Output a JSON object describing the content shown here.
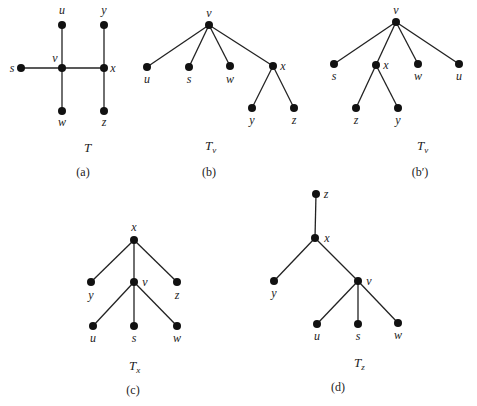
{
  "figures": [
    {
      "id": "a",
      "caption": "(a)",
      "tree_name": "T",
      "tree_sub": "",
      "name_pos": [
        84,
        152
      ],
      "caption_pos": [
        83,
        176
      ],
      "nodes": [
        {
          "id": "u",
          "x": 62,
          "y": 25,
          "lx": 62,
          "ly": 14,
          "anchor": "middle"
        },
        {
          "id": "y",
          "x": 104,
          "y": 25,
          "lx": 104,
          "ly": 14,
          "anchor": "middle"
        },
        {
          "id": "s",
          "x": 21,
          "y": 68,
          "lx": 12,
          "ly": 72,
          "anchor": "middle"
        },
        {
          "id": "v",
          "x": 62,
          "y": 68,
          "lx": 55,
          "ly": 62,
          "anchor": "middle"
        },
        {
          "id": "x",
          "x": 104,
          "y": 68,
          "lx": 113,
          "ly": 72,
          "anchor": "middle"
        },
        {
          "id": "w",
          "x": 62,
          "y": 111,
          "lx": 62,
          "ly": 126,
          "anchor": "middle"
        },
        {
          "id": "z",
          "x": 104,
          "y": 111,
          "lx": 104,
          "ly": 126,
          "anchor": "middle"
        }
      ],
      "edges": [
        [
          "u",
          "v"
        ],
        [
          "v",
          "w"
        ],
        [
          "s",
          "v"
        ],
        [
          "v",
          "x"
        ],
        [
          "y",
          "x"
        ],
        [
          "x",
          "z"
        ]
      ]
    },
    {
      "id": "b",
      "caption": "(b)",
      "tree_name": "T",
      "tree_sub": "v",
      "name_pos": [
        205,
        150
      ],
      "caption_pos": [
        209,
        176
      ],
      "nodes": [
        {
          "id": "v",
          "x": 209,
          "y": 25,
          "lx": 209,
          "ly": 17,
          "anchor": "middle"
        },
        {
          "id": "u",
          "x": 147,
          "y": 67,
          "lx": 147,
          "ly": 83,
          "anchor": "middle"
        },
        {
          "id": "s",
          "x": 189,
          "y": 67,
          "lx": 189,
          "ly": 83,
          "anchor": "middle"
        },
        {
          "id": "w",
          "x": 230,
          "y": 66,
          "lx": 230,
          "ly": 83,
          "anchor": "middle"
        },
        {
          "id": "x",
          "x": 273,
          "y": 66,
          "lx": 283,
          "ly": 70,
          "anchor": "middle"
        },
        {
          "id": "y",
          "x": 252,
          "y": 108,
          "lx": 252,
          "ly": 124,
          "anchor": "middle"
        },
        {
          "id": "z",
          "x": 294,
          "y": 108,
          "lx": 294,
          "ly": 124,
          "anchor": "middle"
        }
      ],
      "edges": [
        [
          "v",
          "u"
        ],
        [
          "v",
          "s"
        ],
        [
          "v",
          "w"
        ],
        [
          "v",
          "x"
        ],
        [
          "x",
          "y"
        ],
        [
          "x",
          "z"
        ]
      ]
    },
    {
      "id": "b-prime",
      "caption": "(b′)",
      "tree_name": "T",
      "tree_sub": "v",
      "name_pos": [
        417,
        150
      ],
      "caption_pos": [
        420,
        176
      ],
      "nodes": [
        {
          "id": "v",
          "x": 396,
          "y": 22,
          "lx": 396,
          "ly": 14,
          "anchor": "middle"
        },
        {
          "id": "s",
          "x": 334,
          "y": 64,
          "lx": 334,
          "ly": 80,
          "anchor": "middle"
        },
        {
          "id": "x",
          "x": 376,
          "y": 65,
          "lx": 386,
          "ly": 69,
          "anchor": "middle"
        },
        {
          "id": "w",
          "x": 418,
          "y": 64,
          "lx": 418,
          "ly": 80,
          "anchor": "middle"
        },
        {
          "id": "u",
          "x": 459,
          "y": 64,
          "lx": 459,
          "ly": 80,
          "anchor": "middle"
        },
        {
          "id": "z",
          "x": 356,
          "y": 108,
          "lx": 356,
          "ly": 124,
          "anchor": "middle"
        },
        {
          "id": "y",
          "x": 398,
          "y": 108,
          "lx": 398,
          "ly": 124,
          "anchor": "middle"
        }
      ],
      "edges": [
        [
          "v",
          "s"
        ],
        [
          "v",
          "x"
        ],
        [
          "v",
          "w"
        ],
        [
          "v",
          "u"
        ],
        [
          "x",
          "z"
        ],
        [
          "x",
          "y"
        ]
      ]
    },
    {
      "id": "c",
      "caption": "(c)",
      "tree_name": "T",
      "tree_sub": "x",
      "name_pos": [
        129,
        370
      ],
      "caption_pos": [
        133,
        394
      ],
      "nodes": [
        {
          "id": "x",
          "x": 134,
          "y": 240,
          "lx": 134,
          "ly": 231,
          "anchor": "middle"
        },
        {
          "id": "y",
          "x": 91,
          "y": 282,
          "lx": 91,
          "ly": 299,
          "anchor": "middle"
        },
        {
          "id": "v",
          "x": 134,
          "y": 282,
          "lx": 145,
          "ly": 286,
          "anchor": "middle"
        },
        {
          "id": "z",
          "x": 177,
          "y": 282,
          "lx": 177,
          "ly": 299,
          "anchor": "middle"
        },
        {
          "id": "u",
          "x": 93,
          "y": 326,
          "lx": 93,
          "ly": 342,
          "anchor": "middle"
        },
        {
          "id": "s",
          "x": 134,
          "y": 326,
          "lx": 134,
          "ly": 342,
          "anchor": "middle"
        },
        {
          "id": "w",
          "x": 177,
          "y": 326,
          "lx": 177,
          "ly": 342,
          "anchor": "middle"
        }
      ],
      "edges": [
        [
          "x",
          "y"
        ],
        [
          "x",
          "v"
        ],
        [
          "x",
          "z"
        ],
        [
          "v",
          "u"
        ],
        [
          "v",
          "s"
        ],
        [
          "v",
          "w"
        ]
      ]
    },
    {
      "id": "d",
      "caption": "(d)",
      "tree_name": "T",
      "tree_sub": "z",
      "name_pos": [
        354,
        367
      ],
      "caption_pos": [
        338,
        391
      ],
      "nodes": [
        {
          "id": "z",
          "x": 316,
          "y": 194,
          "lx": 326,
          "ly": 198,
          "anchor": "middle"
        },
        {
          "id": "x",
          "x": 315,
          "y": 238,
          "lx": 327,
          "ly": 242,
          "anchor": "middle"
        },
        {
          "id": "y",
          "x": 274,
          "y": 281,
          "lx": 274,
          "ly": 297,
          "anchor": "middle"
        },
        {
          "id": "v",
          "x": 358,
          "y": 281,
          "lx": 369,
          "ly": 285,
          "anchor": "middle"
        },
        {
          "id": "u",
          "x": 317,
          "y": 324,
          "lx": 317,
          "ly": 340,
          "anchor": "middle"
        },
        {
          "id": "s",
          "x": 358,
          "y": 324,
          "lx": 358,
          "ly": 340,
          "anchor": "middle"
        },
        {
          "id": "w",
          "x": 398,
          "y": 323,
          "lx": 398,
          "ly": 339,
          "anchor": "middle"
        }
      ],
      "edges": [
        [
          "z",
          "x"
        ],
        [
          "x",
          "y"
        ],
        [
          "x",
          "v"
        ],
        [
          "v",
          "u"
        ],
        [
          "v",
          "s"
        ],
        [
          "v",
          "w"
        ]
      ]
    }
  ],
  "style": {
    "node_color": "#111111",
    "edge_color": "#222222",
    "node_radius": 4
  }
}
